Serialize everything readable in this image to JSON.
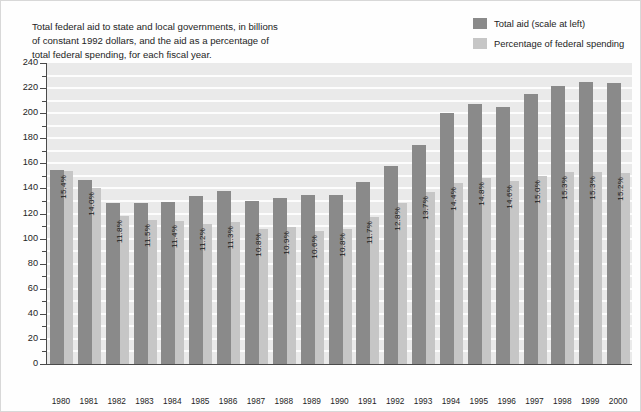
{
  "caption": "Total federal aid to state and local governments, in billions\nof constant 1992 dollars, and the aid as a percentage of\ntotal federal spending, for each fiscal year.",
  "legend": {
    "items": [
      {
        "label": "Total aid (scale at left)",
        "color": "#8a8a8a",
        "name": "total-aid"
      },
      {
        "label": "Percentage of federal spending",
        "color": "#c6c6c6",
        "name": "percentage-federal-spending"
      }
    ]
  },
  "colors": {
    "total_aid_bar": "#8a8a8a",
    "percentage_bar": "#c6c6c6",
    "plot_background": "#eaeaea",
    "gridline": "#fdfdfd",
    "axis": "#4a4a4a",
    "text": "#242424"
  },
  "chart_data": {
    "type": "bar",
    "title": "Total federal aid to state and local governments, in billions of constant 1992 dollars, and the aid as a percentage of total federal spending, for each fiscal year.",
    "xlabel": "",
    "ylabel": "",
    "ylim": [
      0,
      240
    ],
    "ytick_step": 20,
    "yminor_step": 10,
    "ytick_labels": [
      "0",
      "20",
      "40",
      "60",
      "80",
      "100",
      "120",
      "140",
      "160",
      "180",
      "200",
      "220",
      "240"
    ],
    "grid": true,
    "legend_position": "top-right",
    "categories": [
      "1980",
      "1981",
      "1982",
      "1983",
      "1984",
      "1985",
      "1986",
      "1987",
      "1988",
      "1989",
      "1990",
      "1991",
      "1992",
      "1993",
      "1994",
      "1995",
      "1996",
      "1997",
      "1998",
      "1999",
      "2000"
    ],
    "series": [
      {
        "name": "Total aid (scale at left)",
        "unit": "billions of constant 1992 dollars",
        "color": "#8a8a8a",
        "values": [
          155,
          147,
          128,
          128,
          129,
          134,
          138,
          130,
          132,
          135,
          135,
          145,
          158,
          175,
          200,
          207,
          205,
          215,
          222,
          225,
          224
        ]
      },
      {
        "name": "Percentage of federal spending",
        "unit": "percent",
        "color": "#c6c6c6",
        "scale": "independent",
        "values": [
          15.4,
          14.0,
          11.8,
          11.5,
          11.4,
          11.2,
          11.3,
          10.8,
          10.9,
          10.6,
          10.8,
          11.7,
          12.8,
          13.7,
          14.4,
          14.8,
          14.6,
          15.0,
          15.3,
          15.3,
          15.2
        ],
        "labels": [
          "15.4%",
          "14.0%",
          "11.8%",
          "11.5%",
          "11.4%",
          "11.2%",
          "11.3%",
          "10.8%",
          "10.9%",
          "10.6%",
          "10.8%",
          "11.7%",
          "12.8%",
          "13.7%",
          "14.4%",
          "14.8%",
          "14.6%",
          "15.0%",
          "15.3%",
          "15.3%",
          "15.2%"
        ]
      }
    ]
  }
}
